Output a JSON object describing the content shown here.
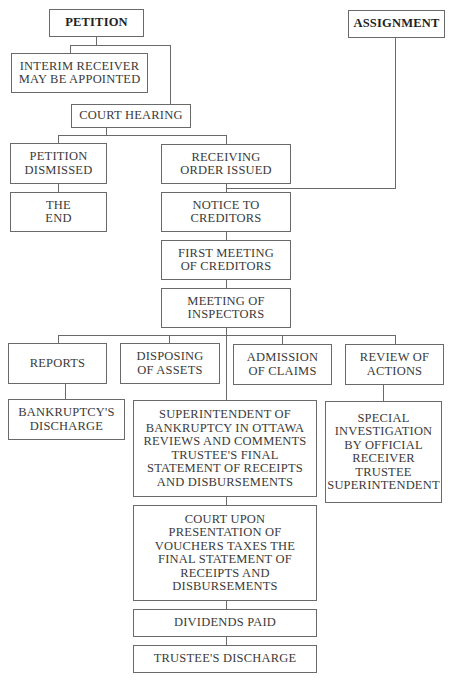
{
  "diagram": {
    "type": "flowchart",
    "nodes": {
      "petition": "PETITION",
      "assignment": "ASSIGNMENT",
      "interim_receiver": "INTERIM RECEIVER\nMAY BE APPOINTED",
      "court_hearing": "COURT HEARING",
      "petition_dismissed": "PETITION\nDISMISSED",
      "the_end": "THE\nEND",
      "receiving_order": "RECEIVING\nORDER ISSUED",
      "notice_to_creditors": "NOTICE TO\nCREDITORS",
      "first_meeting": "FIRST MEETING\nOF CREDITORS",
      "meeting_inspectors": "MEETING OF\nINSPECTORS",
      "reports": "REPORTS",
      "disposing_assets": "DISPOSING\nOF ASSETS",
      "admission_claims": "ADMISSION\nOF CLAIMS",
      "review_actions": "REVIEW OF\nACTIONS",
      "bankruptcy_discharge": "BANKRUPTCY'S\nDISCHARGE",
      "superintendent_review": "SUPERINTENDENT OF\nBANKRUPTCY IN OTTAWA\nREVIEWS AND COMMENTS\nTRUSTEE'S FINAL\nSTATEMENT OF RECEIPTS\nAND DISBURSEMENTS",
      "special_investigation": "SPECIAL\nINVESTIGATION\nBY OFFICIAL\nRECEIVER\nTRUSTEE\nSUPERINTENDENT",
      "court_taxes": "COURT UPON\nPRESENTATION OF\nVOUCHERS TAXES THE\nFINAL STATEMENT OF\nRECEIPTS AND\nDISBURSEMENTS",
      "dividends_paid": "DIVIDENDS PAID",
      "trustee_discharge": "TRUSTEE'S DISCHARGE"
    },
    "edges": [
      [
        "petition",
        "interim_receiver"
      ],
      [
        "petition",
        "court_hearing"
      ],
      [
        "court_hearing",
        "petition_dismissed"
      ],
      [
        "court_hearing",
        "receiving_order"
      ],
      [
        "petition_dismissed",
        "the_end"
      ],
      [
        "receiving_order",
        "notice_to_creditors"
      ],
      [
        "assignment",
        "notice_to_creditors"
      ],
      [
        "notice_to_creditors",
        "first_meeting"
      ],
      [
        "first_meeting",
        "meeting_inspectors"
      ],
      [
        "meeting_inspectors",
        "reports"
      ],
      [
        "meeting_inspectors",
        "disposing_assets"
      ],
      [
        "meeting_inspectors",
        "admission_claims"
      ],
      [
        "meeting_inspectors",
        "review_actions"
      ],
      [
        "meeting_inspectors",
        "superintendent_review"
      ],
      [
        "reports",
        "bankruptcy_discharge"
      ],
      [
        "review_actions",
        "special_investigation"
      ],
      [
        "superintendent_review",
        "court_taxes"
      ],
      [
        "court_taxes",
        "dividends_paid"
      ],
      [
        "dividends_paid",
        "trustee_discharge"
      ]
    ]
  }
}
